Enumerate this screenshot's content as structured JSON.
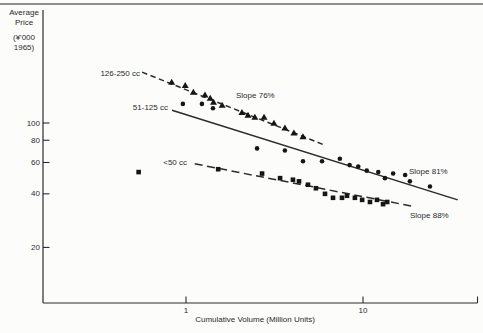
{
  "page": {
    "background": "#fcfcfb",
    "colors": {
      "ink": "#2b2b2b",
      "marker": "#161616",
      "rule": "#8f8f8f"
    }
  },
  "y_axis": {
    "title_lines": [
      "Average",
      "Price",
      "(¥'000",
      "1965)"
    ],
    "ticks": [
      100,
      80,
      60,
      40,
      20
    ]
  },
  "x_axis": {
    "title": "Cumulative Volume (Million Units)",
    "ticks": [
      1,
      10
    ]
  },
  "chart_data": {
    "type": "scatter",
    "x_scale": "log",
    "y_scale": "log",
    "xlabel": "Cumulative Volume (Million Units)",
    "ylabel": "Average Price (¥'000 1965)",
    "x_range": [
      0.16,
      45
    ],
    "y_range": [
      10,
      430
    ],
    "grid": false,
    "series": [
      {
        "name": "126-250 cc",
        "marker": "triangle",
        "line": "dashed",
        "slope_label": "Slope 76%",
        "points": [
          [
            0.83,
            170
          ],
          [
            0.99,
            163
          ],
          [
            1.1,
            149
          ],
          [
            1.28,
            144
          ],
          [
            1.37,
            138
          ],
          [
            1.43,
            131
          ],
          [
            1.6,
            126
          ],
          [
            2.07,
            115
          ],
          [
            2.24,
            111
          ],
          [
            2.45,
            108
          ],
          [
            2.76,
            108
          ],
          [
            3.14,
            100
          ],
          [
            3.62,
            94
          ],
          [
            4.07,
            88
          ],
          [
            4.58,
            84
          ]
        ],
        "trend": {
          "x1": 0.565,
          "y1": 193,
          "x2": 6.1,
          "y2": 75
        }
      },
      {
        "name": "51-125 cc",
        "marker": "circle",
        "line": "solid",
        "slope_label": "Slope 81%",
        "points": [
          [
            0.96,
            128
          ],
          [
            1.23,
            128
          ],
          [
            1.42,
            121
          ],
          [
            2.52,
            72
          ],
          [
            3.62,
            70
          ],
          [
            4.58,
            61
          ],
          [
            5.87,
            61
          ],
          [
            7.4,
            63
          ],
          [
            8.4,
            58
          ],
          [
            9.4,
            57
          ],
          [
            10.5,
            54
          ],
          [
            12.2,
            53
          ],
          [
            13.3,
            49
          ],
          [
            14.8,
            52
          ],
          [
            17.3,
            51
          ],
          [
            18.4,
            47
          ],
          [
            23.9,
            44
          ]
        ],
        "trend": {
          "x1": 0.834,
          "y1": 118,
          "x2": 34.3,
          "y2": 37
        }
      },
      {
        "name": "<50 cc",
        "marker": "square",
        "line": "dashed",
        "slope_label": "Slope 88%",
        "points": [
          [
            0.54,
            53
          ],
          [
            1.52,
            55
          ],
          [
            2.69,
            52
          ],
          [
            3.4,
            49
          ],
          [
            4.02,
            48
          ],
          [
            4.35,
            47
          ],
          [
            4.89,
            45
          ],
          [
            5.42,
            43
          ],
          [
            6.1,
            40
          ],
          [
            6.77,
            38
          ],
          [
            7.61,
            38
          ],
          [
            8.12,
            39
          ],
          [
            9.0,
            38
          ],
          [
            9.89,
            37
          ],
          [
            10.95,
            36
          ],
          [
            11.99,
            37
          ],
          [
            12.98,
            35
          ],
          [
            13.7,
            36
          ]
        ],
        "trend": {
          "x1": 1.12,
          "y1": 59,
          "x2": 19.2,
          "y2": 34
        }
      }
    ]
  }
}
